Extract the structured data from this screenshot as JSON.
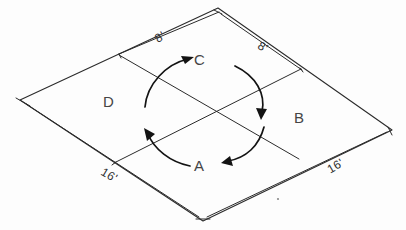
{
  "diagram": {
    "style": "hand-drawn isometric line drawing",
    "ink_color": "#2b2b2b",
    "background_color": "#fdfdfd",
    "quadrants": [
      {
        "id": "A",
        "label": "A",
        "position": "front / bottom",
        "x": 200,
        "y": 167
      },
      {
        "id": "B",
        "label": "B",
        "position": "right",
        "x": 301,
        "y": 119
      },
      {
        "id": "C",
        "label": "C",
        "position": "back / top",
        "x": 212,
        "y": 61
      },
      {
        "id": "D",
        "label": "D",
        "position": "left",
        "x": 110,
        "y": 103
      }
    ],
    "dimensions": [
      {
        "id": "top-left-edge",
        "label": "8'",
        "value": 8,
        "unit": "ft",
        "edge": "upper-left",
        "x": 163,
        "y": 38
      },
      {
        "id": "top-right-edge",
        "label": "8'",
        "value": 8,
        "unit": "ft",
        "edge": "upper-right",
        "x": 265,
        "y": 47
      },
      {
        "id": "bottom-left-edge",
        "label": "16'",
        "value": 16,
        "unit": "ft",
        "edge": "lower-left",
        "x": 110,
        "y": 176
      },
      {
        "id": "bottom-right-edge",
        "label": "16'",
        "value": 16,
        "unit": "ft",
        "edge": "lower-right",
        "x": 336,
        "y": 167
      }
    ],
    "rotation_arrows": [
      {
        "id": "arrow-d-to-c",
        "from_quadrant": "D",
        "to_quadrant": "C",
        "direction": "up-right"
      },
      {
        "id": "arrow-c-to-b",
        "from_quadrant": "C",
        "to_quadrant": "B",
        "direction": "down"
      },
      {
        "id": "arrow-b-to-a",
        "from_quadrant": "B",
        "to_quadrant": "A",
        "direction": "down-left"
      },
      {
        "id": "arrow-a-to-d",
        "from_quadrant": "A",
        "to_quadrant": "D",
        "direction": "up-left"
      }
    ],
    "rotation_sense": "clockwise",
    "corners": {
      "top": {
        "x": 218,
        "y": 8
      },
      "right": {
        "x": 392,
        "y": 130
      },
      "bottom": {
        "x": 203,
        "y": 221
      },
      "left": {
        "x": 20,
        "y": 100
      }
    }
  }
}
